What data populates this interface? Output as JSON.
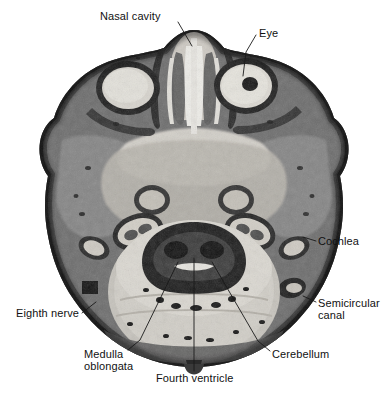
{
  "figure": {
    "type": "anatomical-cross-section",
    "view": "axial section through human head",
    "modality": "grayscale photographic section",
    "background_color": "#ffffff",
    "label_color": "#111111",
    "leader_line_color": "#1a1a1a"
  },
  "labels": [
    {
      "id": "nasal-cavity",
      "text": "Nasal cavity",
      "lines": [
        "Nasal cavity"
      ],
      "x": 100,
      "y": 10,
      "align": "left",
      "leader": [
        [
          178,
          22
        ],
        [
          192,
          46
        ]
      ]
    },
    {
      "id": "eye",
      "text": "Eye",
      "lines": [
        "Eye"
      ],
      "x": 259,
      "y": 27,
      "align": "left",
      "leader": [
        [
          256,
          35
        ],
        [
          246,
          52
        ],
        [
          243,
          76
        ]
      ]
    },
    {
      "id": "cochlea",
      "text": "Cochlea",
      "lines": [
        "Cochlea"
      ],
      "x": 318,
      "y": 235,
      "align": "left",
      "leader": [
        [
          316,
          241
        ],
        [
          303,
          237
        ]
      ]
    },
    {
      "id": "semicircular-canal",
      "text": "Semicircular canal",
      "lines": [
        "Semicircular",
        "canal"
      ],
      "x": 318,
      "y": 297,
      "align": "left",
      "leader": [
        [
          316,
          302
        ],
        [
          303,
          296
        ]
      ]
    },
    {
      "id": "eighth-nerve",
      "text": "Eighth nerve",
      "lines": [
        "Eighth nerve"
      ],
      "x": 16,
      "y": 307,
      "align": "left",
      "leader": [
        [
          82,
          313
        ],
        [
          96,
          302
        ]
      ]
    },
    {
      "id": "medulla-oblongata",
      "text": "Medulla oblongata",
      "lines": [
        "Medulla",
        "oblongata"
      ],
      "x": 84,
      "y": 348,
      "align": "left",
      "leader": [
        [
          128,
          350
        ],
        [
          140,
          340
        ],
        [
          178,
          262
        ]
      ]
    },
    {
      "id": "cerebellum",
      "text": "Cerebellum",
      "lines": [
        "Cerebellum"
      ],
      "x": 272,
      "y": 348,
      "align": "left",
      "leader": [
        [
          270,
          351
        ],
        [
          258,
          341
        ],
        [
          212,
          262
        ]
      ]
    },
    {
      "id": "fourth-ventricle",
      "text": "Fourth ventricle",
      "lines": [
        "Fourth ventricle"
      ],
      "x": 156,
      "y": 372,
      "align": "left",
      "leader": [
        [
          194,
          371
        ],
        [
          194,
          258
        ]
      ]
    }
  ],
  "structures": {
    "outer_tissue_fill": "#4a4a4a",
    "skin_edge_fill": "#1c1c1c",
    "brain_fill": "#c9c9c9",
    "muscle_fill": "#7f7f7f",
    "bone_fill": "#e6e6e6",
    "eye_fill": "#dcdcdc",
    "pupil_fill": "#1a1a1a",
    "brainstem_fill": "#2a2a2a"
  }
}
